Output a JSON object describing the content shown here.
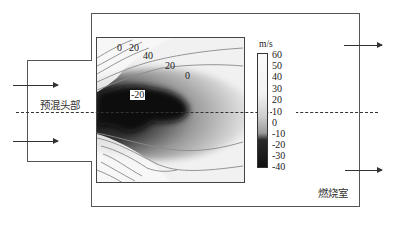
{
  "figure": {
    "type": "velocity contour diagram of premixed combustor",
    "labels": {
      "premix_head": "预混头部",
      "combustion_chamber": "燃烧室"
    },
    "colorbar": {
      "unit": "m/s",
      "ticks": [
        "60",
        "50",
        "40",
        "30",
        "20",
        "10",
        "0",
        "-10",
        "-20",
        "-30",
        "-40"
      ],
      "range": [
        -40,
        60
      ]
    },
    "contour_labels": [
      {
        "text": "0",
        "note": "upper-left contour"
      },
      {
        "text": "20",
        "note": "upper-left contour"
      },
      {
        "text": "40",
        "note": "upper-left contour"
      },
      {
        "text": "20",
        "note": "middle contour"
      },
      {
        "text": "0",
        "note": "zero-velocity contour"
      },
      {
        "text": "-20",
        "note": "recirculation zone (boxed)"
      }
    ],
    "colors": {
      "line": "#555555",
      "contour": "#8a8a8a",
      "dark_zone": "#111111",
      "background": "#ffffff"
    }
  }
}
